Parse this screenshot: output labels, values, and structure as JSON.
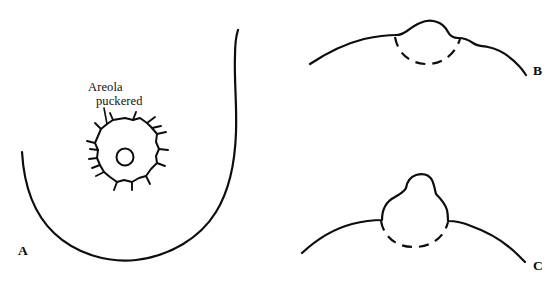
{
  "figure": {
    "background_color": "#ffffff",
    "ink_color": "#0d0d0d",
    "width": 559,
    "height": 286
  },
  "annotations": {
    "areola_label_line1": "Areola",
    "areola_label_line2": "puckered"
  },
  "panels": [
    {
      "id": "A",
      "letter": "A",
      "view": "frontal",
      "description": "Breast outline in frontal view with puckered, irregularly spiked areola and central nipple"
    },
    {
      "id": "B",
      "letter": "B",
      "view": "profile",
      "description": "Breast profile with flattened broad nipple elevation and dashed subsurface arc"
    },
    {
      "id": "C",
      "letter": "C",
      "view": "profile",
      "description": "Breast profile with tall erect protruding nipple and dashed subsurface arc"
    }
  ]
}
